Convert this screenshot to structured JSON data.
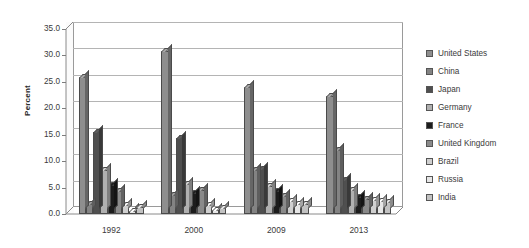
{
  "chart_data": {
    "type": "bar",
    "title": "",
    "subtitle": "",
    "xlabel": "",
    "ylabel": "Percent",
    "ylim": [
      0.0,
      35.0
    ],
    "ytick_step": 5.0,
    "ytick_labels": [
      "35.0",
      "30.0",
      "25.0",
      "20.0",
      "15.0",
      "10.0",
      "5.0",
      "0.0"
    ],
    "grid": true,
    "legend_position": "right",
    "style": "3d-clustered-column",
    "categories": [
      "1992",
      "2000",
      "2009",
      "2013"
    ],
    "series": [
      {
        "name": "United States",
        "color": "#8e8e8e",
        "values": [
          26.0,
          30.8,
          24.0,
          22.3
        ]
      },
      {
        "name": "China",
        "color": "#838383",
        "values": [
          1.9,
          3.6,
          8.4,
          12.2
        ]
      },
      {
        "name": "Japan",
        "color": "#4f4f4f",
        "values": [
          15.5,
          14.3,
          8.6,
          6.4
        ]
      },
      {
        "name": "Germany",
        "color": "#b0b0b0",
        "values": [
          8.4,
          5.6,
          5.3,
          4.6
        ]
      },
      {
        "name": "France",
        "color": "#1c1c1c",
        "values": [
          5.5,
          4.0,
          4.3,
          3.3
        ]
      },
      {
        "name": "United Kingdom",
        "color": "#8a8a8a",
        "values": [
          4.4,
          4.5,
          3.5,
          2.9
        ]
      },
      {
        "name": "Brazil",
        "color": "#cfcfcf",
        "values": [
          1.7,
          1.7,
          2.4,
          2.6
        ]
      },
      {
        "name": "Russia",
        "color": "#e6e6e6",
        "values": [
          0.6,
          0.7,
          1.9,
          2.4
        ]
      },
      {
        "name": "India",
        "color": "#c2c2c2",
        "values": [
          1.3,
          1.2,
          1.9,
          2.2
        ]
      }
    ]
  },
  "legend": {
    "items": [
      {
        "label": "United States"
      },
      {
        "label": "China"
      },
      {
        "label": "Japan"
      },
      {
        "label": "Germany"
      },
      {
        "label": "France"
      },
      {
        "label": "United Kingdom"
      },
      {
        "label": "Brazil"
      },
      {
        "label": "Russia"
      },
      {
        "label": "India"
      }
    ]
  }
}
